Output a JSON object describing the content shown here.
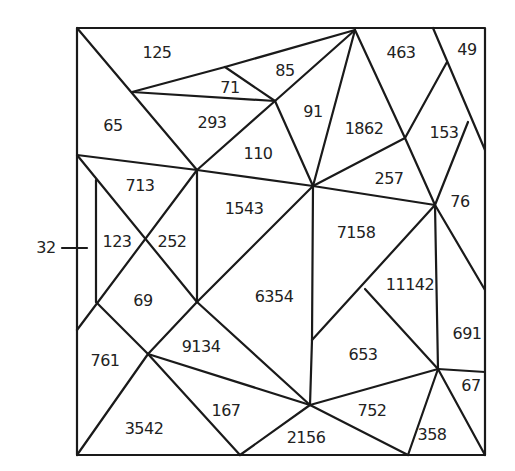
{
  "diagram": {
    "side_label": "32",
    "region_values": [
      {
        "id": "r125",
        "value": "125",
        "x": 157,
        "y": 52
      },
      {
        "id": "r71",
        "value": "71",
        "x": 230,
        "y": 87
      },
      {
        "id": "r85",
        "value": "85",
        "x": 285,
        "y": 70
      },
      {
        "id": "r65",
        "value": "65",
        "x": 113,
        "y": 125
      },
      {
        "id": "r293",
        "value": "293",
        "x": 212,
        "y": 122
      },
      {
        "id": "r91",
        "value": "91",
        "x": 313,
        "y": 111
      },
      {
        "id": "r463",
        "value": "463",
        "x": 401,
        "y": 52
      },
      {
        "id": "r49",
        "value": "49",
        "x": 467,
        "y": 49
      },
      {
        "id": "r1862",
        "value": "1862",
        "x": 364,
        "y": 128
      },
      {
        "id": "r153",
        "value": "153",
        "x": 444,
        "y": 132
      },
      {
        "id": "r110",
        "value": "110",
        "x": 258,
        "y": 153
      },
      {
        "id": "r257",
        "value": "257",
        "x": 389,
        "y": 178
      },
      {
        "id": "r713",
        "value": "713",
        "x": 140,
        "y": 185
      },
      {
        "id": "r76",
        "value": "76",
        "x": 460,
        "y": 201
      },
      {
        "id": "r1543",
        "value": "1543",
        "x": 244,
        "y": 208
      },
      {
        "id": "r7158",
        "value": "7158",
        "x": 356,
        "y": 232
      },
      {
        "id": "r123",
        "value": "123",
        "x": 117,
        "y": 241
      },
      {
        "id": "r252",
        "value": "252",
        "x": 172,
        "y": 241
      },
      {
        "id": "r11142",
        "value": "11142",
        "x": 410,
        "y": 284
      },
      {
        "id": "r69",
        "value": "69",
        "x": 143,
        "y": 300
      },
      {
        "id": "r6354",
        "value": "6354",
        "x": 274,
        "y": 296
      },
      {
        "id": "r691",
        "value": "691",
        "x": 467,
        "y": 333
      },
      {
        "id": "r761",
        "value": "761",
        "x": 105,
        "y": 360
      },
      {
        "id": "r9134",
        "value": "9134",
        "x": 201,
        "y": 346
      },
      {
        "id": "r653",
        "value": "653",
        "x": 363,
        "y": 354
      },
      {
        "id": "r67",
        "value": "67",
        "x": 471,
        "y": 385
      },
      {
        "id": "r167",
        "value": "167",
        "x": 226,
        "y": 410
      },
      {
        "id": "r752",
        "value": "752",
        "x": 372,
        "y": 410
      },
      {
        "id": "r3542",
        "value": "3542",
        "x": 144,
        "y": 428
      },
      {
        "id": "r358",
        "value": "358",
        "x": 432,
        "y": 434
      },
      {
        "id": "r2156",
        "value": "2156",
        "x": 306,
        "y": 437
      }
    ]
  }
}
